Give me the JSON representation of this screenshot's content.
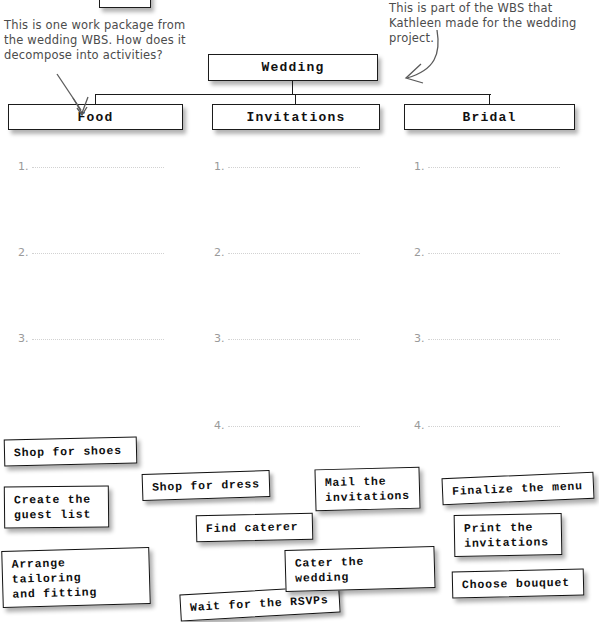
{
  "wbs": {
    "root": {
      "label": "Wedding"
    },
    "children": [
      {
        "label": "Food"
      },
      {
        "label": "Invitations"
      },
      {
        "label": "Bridal"
      }
    ]
  },
  "annotations": [
    {
      "name": "work-package-question",
      "text": "This is one work package from the wedding WBS. How does it decompose into activities?"
    },
    {
      "name": "wbs-source-note",
      "text": "This is part of the WBS that Kathleen made for the wedding project."
    }
  ],
  "blank_lists": [
    {
      "column": "Food",
      "numbers": [
        "1.",
        "2.",
        "3."
      ]
    },
    {
      "column": "Invitations",
      "numbers": [
        "1.",
        "2.",
        "3.",
        "4."
      ]
    },
    {
      "column": "Bridal",
      "numbers": [
        "1.",
        "2.",
        "3.",
        "4."
      ]
    }
  ],
  "activity_cards": [
    {
      "id": "shop-for-shoes",
      "label": "Shop for shoes"
    },
    {
      "id": "create-the-guest-list",
      "label": "Create the\nguest list"
    },
    {
      "id": "arrange-tailoring-and-fitting",
      "label": "Arrange tailoring\nand fitting"
    },
    {
      "id": "shop-for-dress",
      "label": "Shop for dress"
    },
    {
      "id": "find-caterer",
      "label": "Find caterer"
    },
    {
      "id": "wait-for-the-rsvps",
      "label": "Wait for the RSVPs"
    },
    {
      "id": "mail-the-invitations",
      "label": "Mail the\ninvitations"
    },
    {
      "id": "cater-the-wedding",
      "label": "Cater the wedding"
    },
    {
      "id": "finalize-the-menu",
      "label": "Finalize the menu"
    },
    {
      "id": "print-the-invitations",
      "label": "Print the\ninvitations"
    },
    {
      "id": "choose-bouquet",
      "label": "Choose bouquet"
    }
  ],
  "colors": {
    "ink": "#111111",
    "handwriting": "#4c4c4c",
    "rule": "#d2d2d2",
    "page": "#ffffff"
  }
}
